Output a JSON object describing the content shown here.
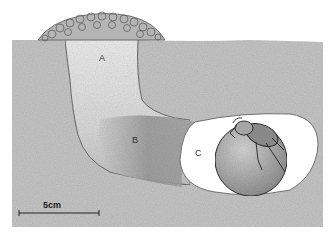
{
  "figure": {
    "type": "burrow-cross-section",
    "labels": {
      "a": "A",
      "b": "B",
      "c": "C"
    },
    "scale_bar": {
      "label": "5cm"
    },
    "colors": {
      "soil": "#c9c9c9",
      "shaft_fill": "#e6e6e6",
      "tunnel_fill": "#a8a8a8",
      "chamber": "#ffffff",
      "brood_ball": "#bdbdbd",
      "outline": "#444444"
    }
  }
}
